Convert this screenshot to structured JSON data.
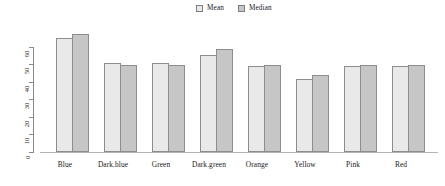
{
  "legend": {
    "position": "top-center",
    "entries": [
      {
        "label": "Mean",
        "color": "#e9e9e9",
        "icon": "square-swatch-icon"
      },
      {
        "label": "Median",
        "color": "#c6c6c6",
        "icon": "square-swatch-icon"
      }
    ]
  },
  "axis": {
    "y_ticks": [
      "0",
      "10",
      "20",
      "30",
      "40",
      "50",
      "60"
    ],
    "x_categories": [
      "Blue",
      "Dark.blue",
      "Green",
      "Dark.green",
      "Orange",
      "Yellow",
      "Pink",
      "Red"
    ]
  },
  "chart_data": {
    "type": "bar",
    "title": "",
    "subtitle": "",
    "xlabel": "",
    "ylabel": "",
    "grid": false,
    "legend_position": "top-center",
    "ylim": [
      0,
      70
    ],
    "yticks": [
      0,
      10,
      20,
      30,
      40,
      50,
      60
    ],
    "categories": [
      "Blue",
      "Dark.blue",
      "Green",
      "Dark.green",
      "Orange",
      "Yellow",
      "Pink",
      "Red"
    ],
    "series": [
      {
        "name": "Mean",
        "color": "#e9e9e9",
        "values": [
          65.0,
          51.0,
          51.0,
          55.5,
          49.0,
          42.0,
          49.0,
          49.0
        ]
      },
      {
        "name": "Median",
        "color": "#c6c6c6",
        "values": [
          67.5,
          50.0,
          50.0,
          59.0,
          50.0,
          44.0,
          50.0,
          50.0
        ]
      }
    ]
  }
}
